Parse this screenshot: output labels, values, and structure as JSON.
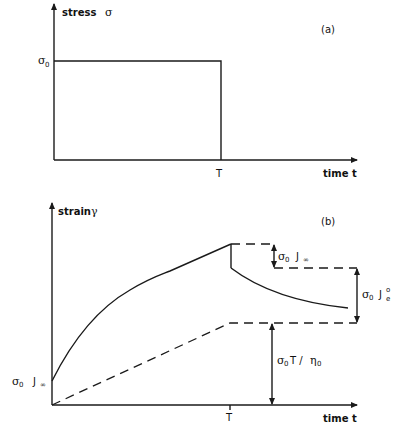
{
  "panel_a": {
    "tag": "(a)",
    "y_axis_label_word": "stress",
    "y_axis_label_symbol": "σ",
    "x_axis_label": "time t",
    "stress_level_label": "σ",
    "stress_level_sub": "0",
    "time_mark_label": "T"
  },
  "panel_b": {
    "tag": "(b)",
    "y_axis_label_word": "strain",
    "y_axis_label_symbol": "γ",
    "x_axis_label": "time t",
    "time_mark_label": "T",
    "instant_label_sigma": "σ",
    "instant_label_sub": "0",
    "instant_label_J": "J",
    "instant_label_Jsub": "∞",
    "recoil_instant_sigma": "σ",
    "recoil_instant_sub": "0",
    "recoil_instant_J": "J",
    "recoil_instant_Jsub": "∞",
    "recoil_elastic_sigma": "σ",
    "recoil_elastic_sub": "0",
    "recoil_elastic_J": "J",
    "recoil_elastic_Jsup": "o",
    "recoil_elastic_Jsub": "e",
    "viscous_sigma": "σ",
    "viscous_sub": "0",
    "viscous_T": "T /",
    "viscous_eta": "η",
    "viscous_eta_sub": "0"
  }
}
